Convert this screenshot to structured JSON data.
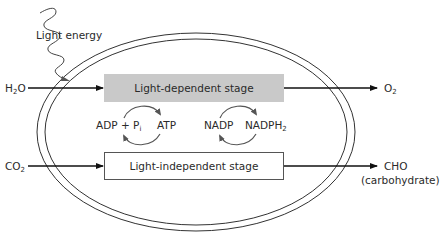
{
  "diagram": {
    "labels": {
      "light_energy": "Light energy",
      "h2o": {
        "base": "H",
        "sub": "2",
        "tail": "O"
      },
      "o2": {
        "base": "O",
        "sub": "2"
      },
      "co2": {
        "base": "CO",
        "sub": "2"
      },
      "cho": "CHO",
      "carbohydrate": "(carbohydrate)",
      "adp_pi": {
        "base": "ADP + P",
        "sub": "i"
      },
      "atp": "ATP",
      "nadp": "NADP",
      "nadph2": {
        "base": "NADPH",
        "sub": "2"
      }
    },
    "stages": [
      {
        "label": "Light-dependent stage",
        "fill": "#c9c9c9"
      },
      {
        "label": "Light-independent stage",
        "fill": "#ffffff"
      }
    ],
    "colors": {
      "line": "#222222",
      "cycle_arrow": "#555555",
      "membrane": "#333333"
    }
  }
}
